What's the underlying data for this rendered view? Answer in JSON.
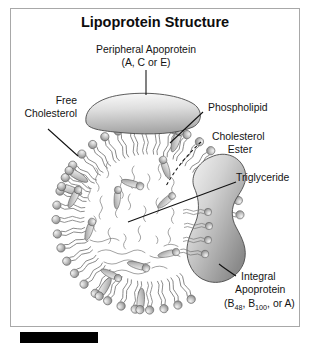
{
  "figure": {
    "title": "Lipoprotein Structure",
    "type": "biological-diagram"
  },
  "labels": {
    "peripheral_apoprotein": {
      "line1": "Peripheral Apoprotein",
      "line2": "(A, C or E)"
    },
    "free_cholesterol": {
      "line1": "Free",
      "line2": "Cholesterol"
    },
    "phospholipid": "Phospholipid",
    "cholesterol_ester": {
      "line1": "Cholesterol",
      "line2": "Ester"
    },
    "triglyceride": "Triglyceride",
    "integral_apoprotein": {
      "line1": "Integral",
      "line2": "Apoprotein",
      "line3_pre": "(B",
      "line3_sub1": "48",
      "line3_mid": ", B",
      "line3_sub2": "100",
      "line3_post": ", or A)"
    }
  },
  "colors": {
    "background": "#ffffff",
    "frame_border": "#a8a8a8",
    "text": "#141414",
    "leader_line": "#111111",
    "head_fill_light": "#e2e2e2",
    "head_fill_mid": "#a9a9a9",
    "head_stroke": "#5c5c5c",
    "tail_stroke": "#6f6f6f",
    "apoprotein_light": "#f0f0f0",
    "apoprotein_mid": "#c9c9c9",
    "apoprotein_dark": "#8e8e8e",
    "accent_black": "#000000"
  },
  "components": [
    {
      "name": "phospholipid-monolayer",
      "description": "ring of spherical head groups with paired wavy hydrocarbon tails pointing inward"
    },
    {
      "name": "free-cholesterol",
      "description": "teardrop shaped molecules embedded in the monolayer"
    },
    {
      "name": "core-lipids",
      "description": "cholesterol esters and triglycerides filling the hydrophobic core"
    },
    {
      "name": "peripheral-apoprotein",
      "description": "elongated curved protein resting on the particle surface"
    },
    {
      "name": "integral-apoprotein",
      "description": "large kidney shaped protein spanning the monolayer"
    }
  ]
}
